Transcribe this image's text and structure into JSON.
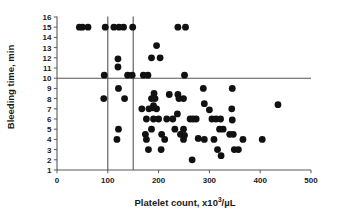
{
  "chart_data": {
    "type": "scatter",
    "title": "",
    "xlabel": "Platelet count, x10³/µL",
    "ylabel": "Bleeding time, min",
    "xlim": [
      0,
      500
    ],
    "ylim": [
      1,
      16
    ],
    "xticks": [
      0,
      100,
      200,
      300,
      400,
      500
    ],
    "yticks": [
      1,
      2,
      3,
      4,
      5,
      6,
      7,
      8,
      9,
      10,
      11,
      12,
      13,
      14,
      15,
      16
    ],
    "grid": false,
    "legend": null,
    "marker": {
      "shape": "circle",
      "color": "#111111",
      "size": 3.4
    },
    "reference_lines": [
      {
        "orientation": "vertical",
        "value": 100,
        "color": "#555555",
        "label": ""
      },
      {
        "orientation": "vertical",
        "value": 150,
        "color": "#555555",
        "label": ""
      },
      {
        "orientation": "horizontal",
        "value": 10,
        "color": "#555555",
        "label": ""
      }
    ],
    "points": [
      [
        44,
        15
      ],
      [
        50,
        15
      ],
      [
        61,
        15
      ],
      [
        95,
        15
      ],
      [
        112,
        15
      ],
      [
        122,
        15
      ],
      [
        131,
        15
      ],
      [
        149,
        15
      ],
      [
        238,
        15
      ],
      [
        253,
        15
      ],
      [
        196,
        13.2
      ],
      [
        186,
        12.0
      ],
      [
        203,
        12.0
      ],
      [
        120,
        11.9
      ],
      [
        120,
        11.1
      ],
      [
        93,
        10.3
      ],
      [
        139,
        10.3
      ],
      [
        148,
        10.3
      ],
      [
        170,
        10.3
      ],
      [
        179,
        10.3
      ],
      [
        251,
        10.3
      ],
      [
        121,
        9.0
      ],
      [
        288,
        9.0
      ],
      [
        345,
        9.0
      ],
      [
        92,
        8.0
      ],
      [
        133,
        8.0
      ],
      [
        191,
        8.5
      ],
      [
        221,
        8.4
      ],
      [
        238,
        8.4
      ],
      [
        186,
        8.0
      ],
      [
        193,
        8.0
      ],
      [
        240,
        8.0
      ],
      [
        249,
        8.0
      ],
      [
        290,
        7.5
      ],
      [
        435,
        7.4
      ],
      [
        167,
        7.0
      ],
      [
        181,
        7.0
      ],
      [
        189,
        7.1
      ],
      [
        190,
        7.3
      ],
      [
        196,
        7.0
      ],
      [
        237,
        6.5
      ],
      [
        300,
        6.9
      ],
      [
        344,
        7.0
      ],
      [
        176,
        6.0
      ],
      [
        190,
        6.0
      ],
      [
        200,
        6.0
      ],
      [
        216,
        6.0
      ],
      [
        228,
        6.0
      ],
      [
        262,
        6.0
      ],
      [
        268,
        6.0
      ],
      [
        274,
        6.0
      ],
      [
        305,
        6.0
      ],
      [
        313,
        6.0
      ],
      [
        322,
        6.0
      ],
      [
        345,
        5.9
      ],
      [
        121,
        5.0
      ],
      [
        186,
        5.0
      ],
      [
        232,
        5.0
      ],
      [
        249,
        5.0
      ],
      [
        320,
        5.0
      ],
      [
        327,
        5.0
      ],
      [
        174,
        4.5
      ],
      [
        206,
        4.5
      ],
      [
        243,
        4.5
      ],
      [
        251,
        4.4
      ],
      [
        340,
        4.5
      ],
      [
        347,
        4.5
      ],
      [
        118,
        4.0
      ],
      [
        176,
        4.0
      ],
      [
        212,
        4.0
      ],
      [
        249,
        4.0
      ],
      [
        278,
        4.1
      ],
      [
        290,
        4.0
      ],
      [
        309,
        4.0
      ],
      [
        366,
        4.0
      ],
      [
        404,
        4.0
      ],
      [
        180,
        3.0
      ],
      [
        205,
        3.0
      ],
      [
        316,
        3.0
      ],
      [
        349,
        3.0
      ],
      [
        357,
        3.0
      ],
      [
        323,
        2.4
      ],
      [
        266,
        2.0
      ]
    ]
  }
}
